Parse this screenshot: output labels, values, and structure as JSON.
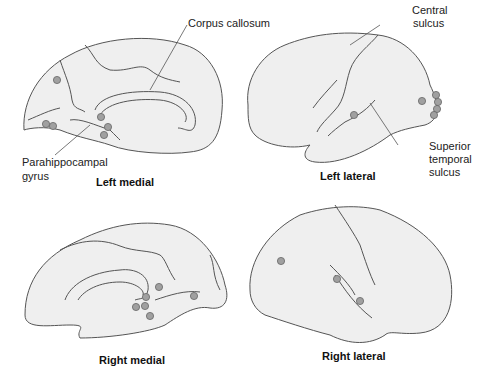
{
  "panels": {
    "left_medial": {
      "title": "Left medial"
    },
    "left_lateral": {
      "title": "Left lateral"
    },
    "right_medial": {
      "title": "Right medial"
    },
    "right_lateral": {
      "title": "Right lateral"
    }
  },
  "annotations": {
    "corpus_callosum": "Corpus callosum",
    "parahippocampal_line1": "Parahippocampal",
    "parahippocampal_line2": "gyrus",
    "central_line1": "Central",
    "central_line2": "sulcus",
    "sts_line1": "Superior",
    "sts_line2": "temporal",
    "sts_line3": "sulcus"
  },
  "colors": {
    "brain_fill": "#efefef",
    "outline": "#555555",
    "dot_fill": "#a0a0a0",
    "dot_stroke": "#666666"
  }
}
